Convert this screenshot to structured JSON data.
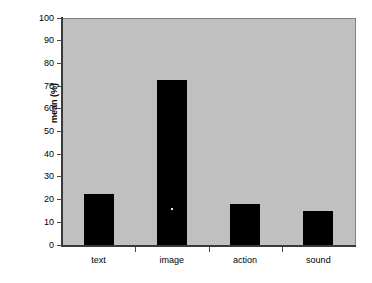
{
  "chart_data": {
    "type": "bar",
    "title": "",
    "subtitle": "",
    "xlabel": "",
    "ylabel": "mean (%)",
    "categories": [
      "text",
      "image",
      "action",
      "sound"
    ],
    "values": [
      23,
      73,
      18.5,
      15.5
    ],
    "series": [
      {
        "name": "mean",
        "values": [
          23,
          73,
          18.5,
          15.5
        ]
      }
    ],
    "ylim": [
      0,
      100
    ],
    "y_ticks": [
      0,
      10,
      20,
      30,
      40,
      50,
      60,
      70,
      80,
      90,
      100
    ],
    "y_tick_labels": [
      "0",
      "10",
      "20",
      "30",
      "40",
      "50",
      "60",
      "70",
      "80",
      "90",
      "100"
    ],
    "grid": false,
    "legend": null,
    "legend_position": "none",
    "annotations": [],
    "colors": {
      "bar": "#000000",
      "plot_background": "#c0c0c0",
      "figure_background": "#ffffff",
      "axis": "#3a3a3a",
      "text": "#000000"
    }
  }
}
